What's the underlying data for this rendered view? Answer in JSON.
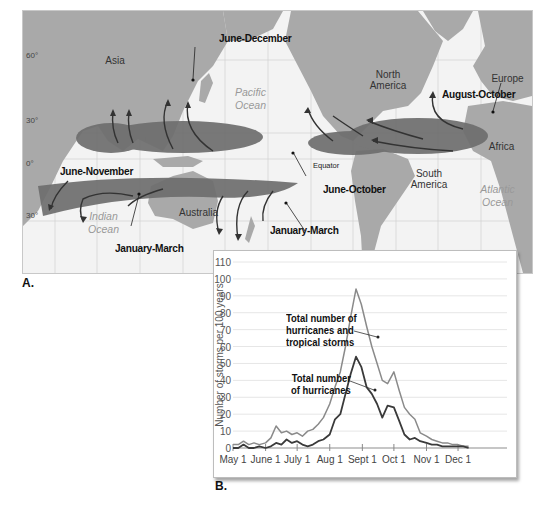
{
  "panel_a": {
    "letter": "A.",
    "latitudes": [
      "60°",
      "30°",
      "0°",
      "30°"
    ],
    "equator_label": "Equator",
    "continents": {
      "asia": "Asia",
      "north_america": "North America",
      "europe": "Europe",
      "africa": "Africa",
      "south_america": "South America",
      "australia": "Australia"
    },
    "oceans": {
      "pacific": "Pacific Ocean",
      "indian": "Indian Ocean",
      "atlantic": "Atlantic Ocean"
    },
    "seasons": {
      "nw_pacific": "June-December",
      "n_atlantic": "August-October",
      "n_indian": "June-November",
      "ne_pacific": "June-October",
      "s_indian": "January-March",
      "sw_pacific": "January-March"
    }
  },
  "panel_b": {
    "letter": "B.",
    "annotation_total": "Total number of hurricanes and tropical storms",
    "annotation_total_lines": [
      "Total number of",
      "hurricanes and",
      "tropical storms"
    ],
    "annotation_hurricanes_lines": [
      "Total number",
      "of hurricanes"
    ]
  },
  "chart_data": {
    "type": "line",
    "title": "",
    "xlabel": "",
    "ylabel": "Number of storms per 100 years",
    "ylim": [
      0,
      110
    ],
    "yticks": [
      0,
      10,
      20,
      30,
      40,
      50,
      60,
      70,
      80,
      90,
      100,
      110
    ],
    "xticks": [
      "May 1",
      "June 1",
      "July 1",
      "Aug 1",
      "Sept 1",
      "Oct 1",
      "Nov 1",
      "Dec 1"
    ],
    "grid": true,
    "x_days_from_may1": [
      0,
      5,
      10,
      15,
      20,
      25,
      31,
      36,
      41,
      46,
      51,
      56,
      61,
      66,
      71,
      76,
      81,
      86,
      92,
      97,
      102,
      107,
      112,
      117,
      122,
      127,
      132,
      137,
      142,
      147,
      153,
      158,
      163,
      168,
      173,
      178,
      184,
      189,
      194,
      199,
      204,
      209,
      214,
      219,
      224
    ],
    "series": [
      {
        "name": "Total number of hurricanes and tropical storms",
        "color": "#8a8a8a",
        "values": [
          2,
          2,
          4,
          2,
          3,
          2,
          3,
          6,
          13,
          9,
          10,
          8,
          9,
          7,
          10,
          11,
          14,
          18,
          26,
          36,
          45,
          60,
          78,
          94,
          85,
          72,
          60,
          50,
          40,
          38,
          45,
          34,
          24,
          20,
          17,
          9,
          7,
          5,
          4,
          3,
          3,
          2,
          2,
          1,
          1
        ]
      },
      {
        "name": "Total number of hurricanes",
        "color": "#3a3a3a",
        "values": [
          0,
          0,
          2,
          0,
          0,
          1,
          0,
          1,
          3,
          2,
          5,
          3,
          4,
          2,
          1,
          2,
          4,
          5,
          8,
          17,
          20,
          32,
          44,
          54,
          48,
          36,
          32,
          26,
          18,
          25,
          24,
          16,
          8,
          5,
          6,
          4,
          3,
          2,
          2,
          1,
          1,
          1,
          1,
          1,
          0
        ]
      }
    ]
  }
}
